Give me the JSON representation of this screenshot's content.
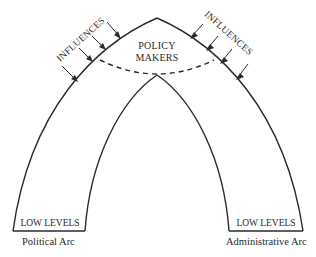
{
  "diagram": {
    "title": "",
    "center_label": {
      "line1": "POLICY",
      "line2": "MAKERS"
    },
    "influences_left": "INFLUENCES",
    "influences_right": "INFLUENCES",
    "left_arc": {
      "base_label": "LOW LEVELS",
      "caption": "Political Arc"
    },
    "right_arc": {
      "base_label": "LOW LEVELS",
      "caption": "Administrative Arc"
    },
    "arrows_per_side": 4,
    "colors": {
      "ink": "#2a2a2a",
      "background": "#ffffff"
    }
  }
}
